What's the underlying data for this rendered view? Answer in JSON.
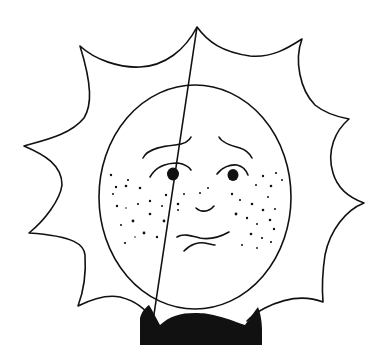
{
  "illustration": {
    "subject": "Worried sun with freckles",
    "description": "Hand-drawn black ink line drawing of a sun with wavy pointed rays, a round face with raised worried eyebrows, dark eyes, freckled cheeks, a small nose and a wavy uneasy mouth, wearing a black collar/bowtie at the bottom.",
    "colors": {
      "background": "#ffffff",
      "ink": "#111111"
    },
    "expression": "worried"
  }
}
